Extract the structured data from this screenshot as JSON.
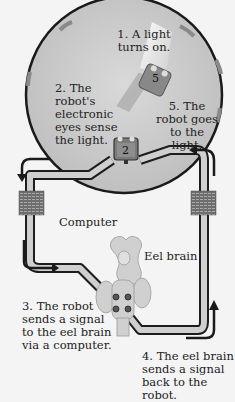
{
  "diagram": {
    "steps": [
      {
        "number": 1,
        "text_lines": [
          "1. A light",
          "turns on."
        ]
      },
      {
        "number": 2,
        "text_lines": [
          "2. The robot's",
          "electronic",
          "eyes sense",
          "the light."
        ]
      },
      {
        "number": 3,
        "text_lines": [
          "3. The robot",
          "sends a signal",
          "to the eel brain",
          "via a computer."
        ]
      },
      {
        "number": 4,
        "text_lines": [
          "4. The eel brain",
          "sends a signal",
          "back to the robot."
        ]
      },
      {
        "number": 5,
        "text_lines": [
          "5. The",
          "robot goes",
          "to the light."
        ]
      }
    ],
    "labels": {
      "computer": "Computer",
      "eel_brain": "Eel brain"
    },
    "robot_markers": {
      "start": "2",
      "end": "5"
    }
  }
}
